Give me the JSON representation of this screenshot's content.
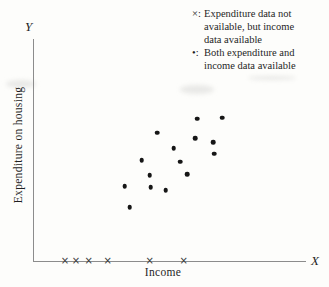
{
  "figure": {
    "y_axis_symbol": "Y",
    "x_axis_symbol": "X",
    "y_axis_label": "Expenditure on housing",
    "x_axis_label": "Income"
  },
  "legend": {
    "items": [
      {
        "marker": "×:",
        "lines": [
          "Expenditure data not",
          "available, but income",
          "data available"
        ]
      },
      {
        "marker": "•:",
        "lines": [
          "Both expenditure and",
          "income data available"
        ]
      }
    ]
  },
  "colors": {
    "bg": "#fdfdfb",
    "text": "#1f1f1f",
    "axis": "#8c8c8c",
    "dot": "#161616",
    "xmark": "#3c3c3c"
  },
  "chart_data": {
    "type": "scatter",
    "title": "",
    "xlabel": "Income",
    "ylabel": "Expenditure on housing",
    "axis_note": "No numeric tick labels shown; point coordinates are percent of plot area (x from y-axis, y up from x-axis), estimated from pixels",
    "xlim": [
      0,
      100
    ],
    "ylim": [
      0,
      100
    ],
    "grid": false,
    "legend_position": "top-right",
    "series": [
      {
        "name": "Both expenditure and income data available",
        "marker": "dot",
        "points": [
          {
            "x": 60.1,
            "y": 64.1
          },
          {
            "x": 69.2,
            "y": 64.6
          },
          {
            "x": 45.4,
            "y": 57.8
          },
          {
            "x": 59.3,
            "y": 55.2
          },
          {
            "x": 65.9,
            "y": 53.4
          },
          {
            "x": 51.3,
            "y": 50.7
          },
          {
            "x": 66.3,
            "y": 48.4
          },
          {
            "x": 39.6,
            "y": 45.3
          },
          {
            "x": 53.8,
            "y": 44.8
          },
          {
            "x": 56.4,
            "y": 39.0
          },
          {
            "x": 42.5,
            "y": 38.6
          },
          {
            "x": 33.3,
            "y": 33.6
          },
          {
            "x": 42.9,
            "y": 33.2
          },
          {
            "x": 48.4,
            "y": 31.8
          },
          {
            "x": 35.2,
            "y": 24.2
          }
        ]
      },
      {
        "name": "Expenditure data not available, but income data available",
        "marker": "x",
        "points": [
          {
            "x": 11.4,
            "y": 0
          },
          {
            "x": 15.4,
            "y": 0
          },
          {
            "x": 20.1,
            "y": 0
          },
          {
            "x": 27.1,
            "y": 0
          },
          {
            "x": 42.5,
            "y": 0
          },
          {
            "x": 55.0,
            "y": 0
          }
        ]
      }
    ]
  }
}
